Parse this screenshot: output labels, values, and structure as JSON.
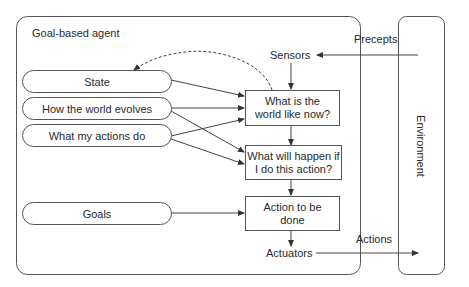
{
  "diagram": {
    "title": "Goal-based agent",
    "agent_components": {
      "state": "State",
      "world_evolves": "How the world evolves",
      "actions_do": "What my actions do",
      "goals": "Goals"
    },
    "process_boxes": {
      "world_now_line1": "What is the",
      "world_now_line2": "world like now?",
      "what_if_line1": "What will happen if",
      "what_if_line2": "I do this action?",
      "action_line1": "Action to be",
      "action_line2": "done"
    },
    "io": {
      "sensors": "Sensors",
      "actuators": "Actuators",
      "precepts": "Precepts",
      "actions": "Actions"
    },
    "environment": "Environment",
    "colors": {
      "stroke": "#555555",
      "text": "#2a2a2a",
      "background": "#ffffff"
    }
  }
}
